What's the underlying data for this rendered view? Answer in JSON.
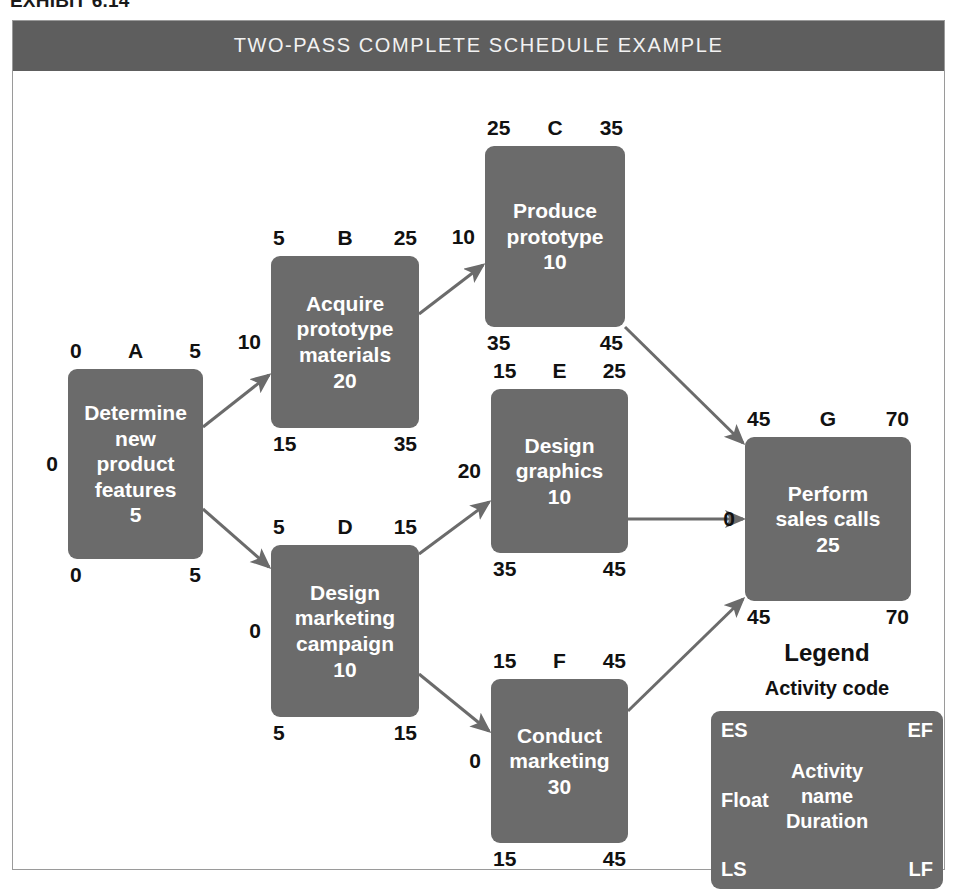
{
  "exhibit": {
    "caption": "EXHIBIT 6.14"
  },
  "figure": {
    "title": "TWO-PASS COMPLETE SCHEDULE EXAMPLE",
    "title_bar_color": "#5e5e5e",
    "node_color": "#6b6b6b",
    "frame_border_color": "#9a9a9a",
    "edge_color": "#6b6b6b"
  },
  "nodes": [
    {
      "id": "A",
      "code": "A",
      "name": "Determine\nnew\nproduct\nfeatures",
      "duration": "5",
      "es": "0",
      "ef": "5",
      "ls": "0",
      "lf": "5",
      "float": "0",
      "x": 55,
      "y": 298,
      "w": 135,
      "h": 190
    },
    {
      "id": "B",
      "code": "B",
      "name": "Acquire\nprototype\nmaterials",
      "duration": "20",
      "es": "5",
      "ef": "25",
      "ls": "15",
      "lf": "35",
      "float": "10",
      "x": 258,
      "y": 185,
      "w": 148,
      "h": 172
    },
    {
      "id": "C",
      "code": "C",
      "name": "Produce\nprototype",
      "duration": "10",
      "es": "25",
      "ef": "35",
      "ls": "35",
      "lf": "45",
      "float": "10",
      "x": 472,
      "y": 75,
      "w": 140,
      "h": 181
    },
    {
      "id": "D",
      "code": "D",
      "name": "Design\nmarketing\ncampaign",
      "duration": "10",
      "es": "5",
      "ef": "15",
      "ls": "5",
      "lf": "15",
      "float": "0",
      "x": 258,
      "y": 474,
      "w": 148,
      "h": 172
    },
    {
      "id": "E",
      "code": "E",
      "name": "Design\ngraphics",
      "duration": "10",
      "es": "15",
      "ef": "25",
      "ls": "35",
      "lf": "45",
      "float": "20",
      "x": 478,
      "y": 318,
      "w": 137,
      "h": 164
    },
    {
      "id": "F",
      "code": "F",
      "name": "Conduct\nmarketing",
      "duration": "30",
      "es": "15",
      "ef": "45",
      "ls": "15",
      "lf": "45",
      "float": "0",
      "x": 478,
      "y": 608,
      "w": 137,
      "h": 164
    },
    {
      "id": "G",
      "code": "G",
      "name": "Perform\nsales calls",
      "duration": "25",
      "es": "45",
      "ef": "70",
      "ls": "45",
      "lf": "70",
      "float": "0",
      "x": 732,
      "y": 366,
      "w": 166,
      "h": 164
    }
  ],
  "edges": [
    {
      "from": "A",
      "to": "B"
    },
    {
      "from": "A",
      "to": "D"
    },
    {
      "from": "B",
      "to": "C"
    },
    {
      "from": "C",
      "to": "G"
    },
    {
      "from": "D",
      "to": "E"
    },
    {
      "from": "D",
      "to": "F"
    },
    {
      "from": "E",
      "to": "G"
    },
    {
      "from": "F",
      "to": "G"
    }
  ],
  "legend": {
    "title": "Legend",
    "subtitle": "Activity code",
    "es": "ES",
    "ef": "EF",
    "float": "Float",
    "center": "Activity\nname\nDuration",
    "ls": "LS",
    "lf": "LF",
    "x": 680,
    "y": 568
  }
}
